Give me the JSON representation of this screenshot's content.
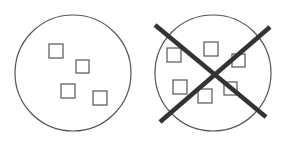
{
  "diagram": {
    "colors": {
      "stroke": "#555555",
      "cross": "#333333",
      "background": "#ffffff"
    },
    "left_panel": {
      "circle": {
        "cx": 73,
        "cy": 73,
        "r": 58
      },
      "squares": [
        {
          "x": 49,
          "y": 44,
          "size": 14
        },
        {
          "x": 76,
          "y": 60,
          "size": 13
        },
        {
          "x": 61,
          "y": 84,
          "size": 14
        },
        {
          "x": 93,
          "y": 91,
          "size": 14
        }
      ],
      "crossed_out": false
    },
    "right_panel": {
      "circle": {
        "cx": 213,
        "cy": 73,
        "r": 58
      },
      "squares": [
        {
          "x": 167,
          "y": 48,
          "size": 14
        },
        {
          "x": 204,
          "y": 42,
          "size": 14
        },
        {
          "x": 232,
          "y": 54,
          "size": 13
        },
        {
          "x": 173,
          "y": 80,
          "size": 14
        },
        {
          "x": 198,
          "y": 89,
          "size": 14
        },
        {
          "x": 224,
          "y": 82,
          "size": 13
        }
      ],
      "crossed_out": true,
      "cross_lines": [
        {
          "x1": 155,
          "y1": 25,
          "x2": 266,
          "y2": 117
        },
        {
          "x1": 270,
          "y1": 27,
          "x2": 160,
          "y2": 122
        }
      ]
    }
  }
}
